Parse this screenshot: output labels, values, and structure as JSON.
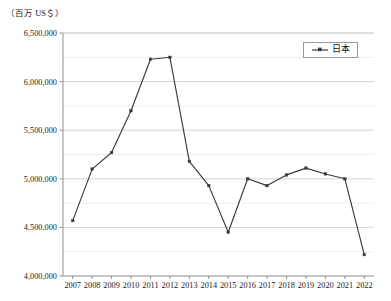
{
  "axis_unit_label": "（百万 US＄）",
  "legend": {
    "position": "top-right",
    "entries": [
      {
        "label": "日本",
        "color": "#3a3a3a",
        "marker": "square-line-marker-icon"
      }
    ]
  },
  "chart_data": {
    "type": "line",
    "title": "",
    "subtitle": "",
    "xlabel": "",
    "ylabel": "（百万 US＄）",
    "categories": [
      "2007",
      "2008",
      "2009",
      "2010",
      "2011",
      "2012",
      "2013",
      "2014",
      "2015",
      "2016",
      "2017",
      "2018",
      "2019",
      "2020",
      "2021",
      "2022"
    ],
    "x": [
      2007,
      2008,
      2009,
      2010,
      2011,
      2012,
      2013,
      2014,
      2015,
      2016,
      2017,
      2018,
      2019,
      2020,
      2021,
      2022
    ],
    "series": [
      {
        "name": "日本",
        "color": "#3a3a3a",
        "values": [
          4570000,
          5100000,
          5270000,
          5700000,
          6230000,
          6250000,
          5180000,
          4930000,
          4450000,
          5000000,
          4930000,
          5040000,
          5110000,
          5050000,
          5000000,
          4220000
        ]
      }
    ],
    "ylim": [
      4000000,
      6500000
    ],
    "ytick_values": [
      4000000,
      4500000,
      5000000,
      5500000,
      6000000,
      6500000
    ],
    "ytick_labels": [
      "4,000,000",
      "4,500,000",
      "5,000,000",
      "5,500,000",
      "6,000,000",
      "6,500,000"
    ],
    "y_minor_step": 250000,
    "grid": {
      "horizontal_major": true,
      "horizontal_minor": true,
      "vertical": false
    },
    "legend_position": "upper right",
    "annotations": []
  },
  "colors": {
    "line": "#3a3a3a",
    "grid_major": "#d4d4d4",
    "grid_minor": "#ededed",
    "axis": "#8f8f8f",
    "text": "#1a1a1a",
    "background": "#ffffff"
  }
}
